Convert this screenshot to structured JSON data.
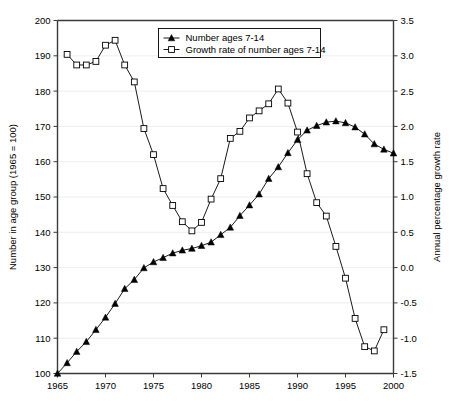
{
  "chart_data": {
    "type": "line",
    "title": "",
    "xlabel": "",
    "ylabel": "Number in age group (1965 = 100)",
    "y2label": "Annual percentage growth rate",
    "xlim": [
      1965,
      2000
    ],
    "ylim": [
      100,
      200
    ],
    "y2lim": [
      -1.5,
      3.5
    ],
    "xticks": [
      1965,
      1970,
      1975,
      1980,
      1985,
      1990,
      1995,
      2000
    ],
    "xticklabels": [
      "1965",
      "1970",
      "1975",
      "1980",
      "1985",
      "1990",
      "1995",
      "2000"
    ],
    "yticks": [
      100,
      110,
      120,
      130,
      140,
      150,
      160,
      170,
      180,
      190,
      200
    ],
    "yticklabels": [
      "100",
      "110",
      "120",
      "130",
      "140",
      "150",
      "160",
      "170",
      "180",
      "190",
      "200"
    ],
    "y2ticks": [
      -1.5,
      -1.0,
      -0.5,
      0.0,
      0.5,
      1.0,
      1.5,
      2.0,
      2.5,
      3.0,
      3.5
    ],
    "y2ticklabels": [
      "-1.5",
      "-1.0",
      "-0.5",
      "0.0",
      "0.5",
      "1.0",
      "1.5",
      "2.0",
      "2.5",
      "3.0",
      "3.5"
    ],
    "grid": true,
    "grid_axis": "y",
    "legend_position": "top-center",
    "x": [
      1965,
      1966,
      1967,
      1968,
      1969,
      1970,
      1971,
      1972,
      1973,
      1974,
      1975,
      1976,
      1977,
      1978,
      1979,
      1980,
      1981,
      1982,
      1983,
      1984,
      1985,
      1986,
      1987,
      1988,
      1989,
      1990,
      1991,
      1992,
      1993,
      1994,
      1995,
      1996,
      1997,
      1998,
      1999,
      2000
    ],
    "series": [
      {
        "name": "Number ages 7-14",
        "axis": "left",
        "marker": "filled-triangle",
        "values": [
          100.0,
          103.0,
          106.2,
          109.0,
          112.4,
          115.9,
          119.8,
          124.0,
          126.6,
          129.9,
          131.6,
          132.8,
          134.1,
          134.9,
          135.4,
          136.2,
          137.2,
          139.3,
          141.4,
          144.7,
          147.7,
          150.8,
          155.2,
          158.5,
          162.5,
          166.2,
          168.9,
          170.2,
          171.2,
          171.5,
          171.0,
          169.8,
          167.8,
          165.0,
          163.5,
          162.4
        ]
      },
      {
        "name": "Growth rate of number ages 7-14",
        "axis": "right",
        "marker": "open-square",
        "values": [
          null,
          3.02,
          2.87,
          2.87,
          2.92,
          3.15,
          3.22,
          2.87,
          2.63,
          1.97,
          1.6,
          1.12,
          0.88,
          0.65,
          0.52,
          0.64,
          0.97,
          1.26,
          1.83,
          1.93,
          2.12,
          2.22,
          2.32,
          2.53,
          2.33,
          1.92,
          1.33,
          0.92,
          0.73,
          0.3,
          -0.15,
          -0.72,
          -1.12,
          -1.18,
          -0.88,
          null
        ]
      }
    ],
    "legend": [
      {
        "label": "Number ages 7-14",
        "marker": "filled-triangle"
      },
      {
        "label": "Growth rate of number ages 7-14",
        "marker": "open-square"
      }
    ]
  },
  "caption": {
    "clipped_text": "clipped caption line"
  }
}
